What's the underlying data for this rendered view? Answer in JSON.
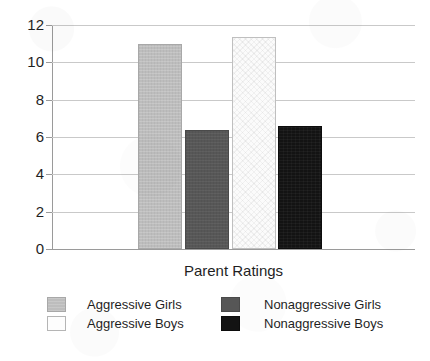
{
  "chart_data": {
    "type": "bar",
    "title": "",
    "subtitle": "",
    "xlabel": "Parent Ratings",
    "ylabel": "",
    "categories": [
      "Parent Ratings"
    ],
    "ylim": [
      0,
      12
    ],
    "yticks": [
      0,
      2,
      4,
      6,
      8,
      10,
      12
    ],
    "ytick_labels": [
      "0",
      "2",
      "4",
      "6",
      "8",
      "10",
      "12"
    ],
    "grid": true,
    "grid_axis": "y",
    "legend_position": "bottom",
    "legend_columns": 2,
    "series": [
      {
        "name": "Aggressive Girls",
        "values": [
          11.0
        ],
        "color": "#bdbdbd",
        "fill": "light-gray",
        "swatch_class": "sw-lightgray",
        "bar_class": "fill-lightgray"
      },
      {
        "name": "Nonaggressive Girls",
        "values": [
          6.35
        ],
        "color": "#575757",
        "fill": "dark-gray",
        "swatch_class": "sw-darkgray",
        "bar_class": "fill-darkgray"
      },
      {
        "name": "Aggressive Boys",
        "values": [
          11.35
        ],
        "color": "#fbfbfb",
        "fill": "white-checkered",
        "swatch_class": "sw-white",
        "bar_class": "fill-white"
      },
      {
        "name": "Nonaggressive Boys",
        "values": [
          6.6
        ],
        "color": "#131313",
        "fill": "black",
        "swatch_class": "sw-black",
        "bar_class": "fill-black"
      }
    ]
  },
  "axis": {
    "y_ticks": [
      {
        "label": "12",
        "value": 12
      },
      {
        "label": "10",
        "value": 10
      },
      {
        "label": "8",
        "value": 8
      },
      {
        "label": "6",
        "value": 6
      },
      {
        "label": "4",
        "value": 4
      },
      {
        "label": "2",
        "value": 2
      },
      {
        "label": "0",
        "value": 0
      }
    ],
    "x_label": "Parent Ratings"
  },
  "legend": {
    "entries": [
      {
        "label": "Aggressive Girls"
      },
      {
        "label": "Aggressive Boys"
      },
      {
        "label": "Nonaggressive Girls"
      },
      {
        "label": "Nonaggressive Boys"
      }
    ]
  }
}
